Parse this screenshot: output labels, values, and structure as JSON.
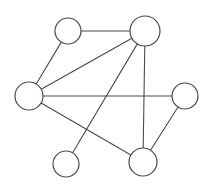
{
  "figure": {
    "background_color": "#ffffff",
    "stroke_color": "#4a4a4a",
    "node_fill_color": "#ffffff",
    "width": 210,
    "height": 187
  },
  "chart_data": {
    "type": "diagram",
    "title": "",
    "xlabel": "",
    "ylabel": "",
    "grid": false,
    "legend": null,
    "node_count": 6,
    "edge_count": 8,
    "nodes": [
      {
        "id": "n1",
        "label": "",
        "x": 68,
        "y": 31,
        "r": 13
      },
      {
        "id": "n2",
        "label": "",
        "x": 145,
        "y": 31,
        "r": 15
      },
      {
        "id": "n3",
        "label": "",
        "x": 29,
        "y": 96,
        "r": 14
      },
      {
        "id": "n4",
        "label": "",
        "x": 185,
        "y": 96,
        "r": 13
      },
      {
        "id": "n5",
        "label": "",
        "x": 66,
        "y": 164,
        "r": 13
      },
      {
        "id": "n6",
        "label": "",
        "x": 143,
        "y": 162,
        "r": 14
      }
    ],
    "edges": [
      {
        "from": "n1",
        "to": "n2"
      },
      {
        "from": "n1",
        "to": "n3"
      },
      {
        "from": "n2",
        "to": "n3"
      },
      {
        "from": "n2",
        "to": "n5"
      },
      {
        "from": "n2",
        "to": "n6"
      },
      {
        "from": "n3",
        "to": "n4"
      },
      {
        "from": "n3",
        "to": "n6"
      },
      {
        "from": "n4",
        "to": "n6"
      }
    ]
  }
}
